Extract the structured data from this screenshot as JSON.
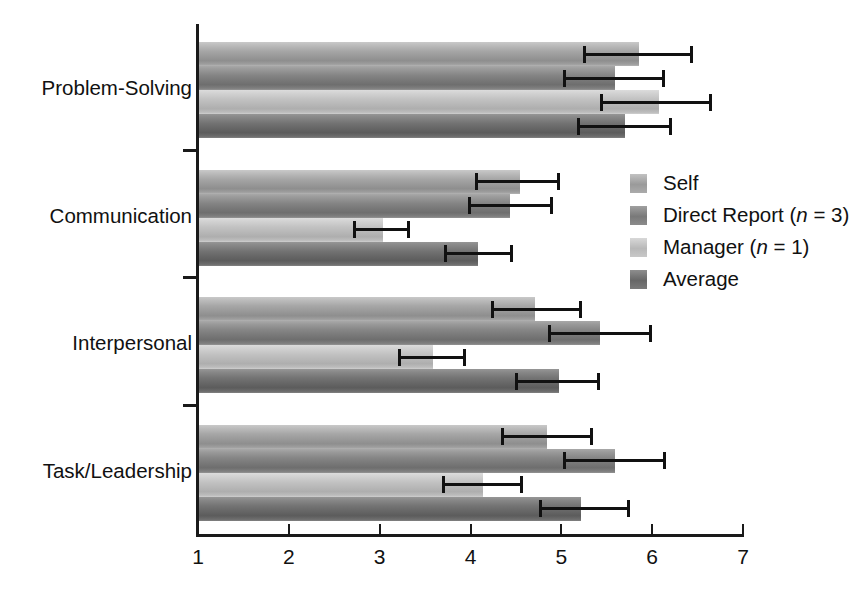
{
  "chart_data": {
    "type": "bar",
    "orientation": "horizontal",
    "title": "",
    "subtitle": "",
    "xlabel": "",
    "ylabel": "",
    "xlim": [
      1,
      7
    ],
    "ylim": null,
    "grid": false,
    "legend_position": "inside-right",
    "xticks": [
      1,
      2,
      3,
      4,
      5,
      6,
      7
    ],
    "xtick_labels": [
      "1",
      "2",
      "3",
      "4",
      "5",
      "6",
      "7"
    ],
    "categories": [
      "Problem-Solving",
      "Communication",
      "Interpersonal",
      "Task/Leadership"
    ],
    "series": [
      {
        "name": "Self",
        "legend_label": "Self",
        "color": "#9a9a9a",
        "values": [
          5.86,
          4.55,
          4.71,
          4.84
        ],
        "error_low": [
          5.24,
          4.05,
          4.23,
          4.34
        ],
        "error_high": [
          6.42,
          4.95,
          5.19,
          5.32
        ]
      },
      {
        "name": "Direct Report",
        "legend_label": "Direct Report (n = 3)",
        "legend_label_pre": "Direct Report (",
        "legend_label_ital": "n",
        "legend_label_post": " = 3)",
        "color": "#797979",
        "values": [
          5.59,
          4.44,
          5.43,
          5.59
        ],
        "error_low": [
          5.02,
          3.97,
          4.85,
          5.02
        ],
        "error_high": [
          6.11,
          4.87,
          5.96,
          6.12
        ]
      },
      {
        "name": "Manager",
        "legend_label": "Manager (n = 1)",
        "legend_label_pre": "Manager (",
        "legend_label_ital": "n",
        "legend_label_post": " = 1)",
        "color": "#b8b8b8",
        "values": [
          6.07,
          3.04,
          3.59,
          4.14
        ],
        "error_low": [
          5.43,
          2.71,
          3.2,
          3.69
        ],
        "error_high": [
          6.63,
          3.3,
          3.92,
          4.55
        ]
      },
      {
        "name": "Average",
        "legend_label": "Average",
        "color": "#676767",
        "values": [
          5.7,
          4.08,
          4.97,
          5.22
        ],
        "error_low": [
          5.17,
          3.71,
          4.49,
          4.75
        ],
        "error_high": [
          6.18,
          4.44,
          5.39,
          5.72
        ]
      }
    ]
  },
  "axis": {
    "x_tick_labels": [
      "1",
      "2",
      "3",
      "4",
      "5",
      "6",
      "7"
    ],
    "y_category_labels": [
      "Problem-Solving",
      "Communication",
      "Interpersonal",
      "Task/Leadership"
    ]
  },
  "legend": {
    "items": [
      {
        "label": "Self"
      },
      {
        "label": "Direct Report (n = 3)"
      },
      {
        "label": "Manager (n = 1)"
      },
      {
        "label": "Average"
      }
    ]
  },
  "colors": {
    "axis": "#1a1a1a",
    "text": "#111111",
    "background": "#ffffff",
    "errorbar": "#111111"
  }
}
